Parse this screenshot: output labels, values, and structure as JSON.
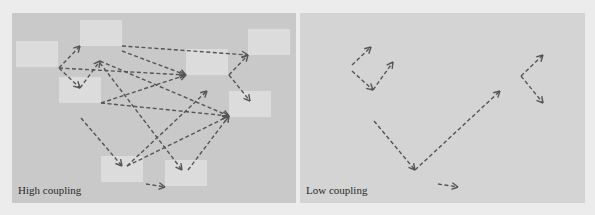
{
  "colors": {
    "page_bg": "#ececec",
    "left_panel_bg": "#c9c9c9",
    "right_panel_bg": "#d4d4d4",
    "module_fill": "#dcdcdc",
    "arrow": "#555555"
  },
  "panels": [
    {
      "id": "high",
      "caption": "High coupling",
      "modules": [
        {
          "x": 4,
          "y": 28,
          "w": 42,
          "h": 26
        },
        {
          "x": 68,
          "y": 7,
          "w": 42,
          "h": 26
        },
        {
          "x": 47,
          "y": 64,
          "w": 42,
          "h": 26
        },
        {
          "x": 174,
          "y": 36,
          "w": 42,
          "h": 26
        },
        {
          "x": 236,
          "y": 16,
          "w": 42,
          "h": 26
        },
        {
          "x": 217,
          "y": 78,
          "w": 42,
          "h": 26
        },
        {
          "x": 89,
          "y": 143,
          "w": 42,
          "h": 26
        },
        {
          "x": 153,
          "y": 147,
          "w": 42,
          "h": 26
        }
      ],
      "arrows": [
        [
          47,
          55,
          68,
          33
        ],
        [
          47,
          55,
          68,
          75
        ],
        [
          47,
          55,
          174,
          62
        ],
        [
          68,
          75,
          88,
          48
        ],
        [
          110,
          33,
          236,
          42
        ],
        [
          110,
          38,
          174,
          62
        ],
        [
          88,
          48,
          217,
          103
        ],
        [
          88,
          50,
          170,
          157
        ],
        [
          89,
          90,
          174,
          62
        ],
        [
          89,
          90,
          217,
          103
        ],
        [
          69,
          105,
          110,
          153
        ],
        [
          115,
          153,
          217,
          103
        ],
        [
          115,
          153,
          195,
          78
        ],
        [
          176,
          157,
          217,
          103
        ],
        [
          217,
          62,
          236,
          42
        ],
        [
          217,
          62,
          238,
          88
        ],
        [
          134,
          171,
          153,
          174
        ]
      ]
    },
    {
      "id": "low",
      "caption": "Low coupling",
      "modules": [],
      "arrows": [
        [
          52,
          52,
          71,
          34
        ],
        [
          52,
          58,
          73,
          77
        ],
        [
          73,
          77,
          93,
          49
        ],
        [
          74,
          108,
          115,
          157
        ],
        [
          115,
          157,
          200,
          78
        ],
        [
          221,
          63,
          243,
          42
        ],
        [
          221,
          63,
          243,
          90
        ],
        [
          138,
          171,
          158,
          174
        ]
      ]
    }
  ]
}
